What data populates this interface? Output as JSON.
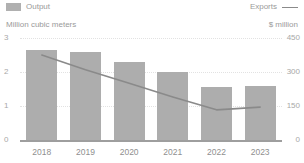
{
  "legend": {
    "output": {
      "label": "Output",
      "icon": "bar-swatch",
      "color": "#b0b0b0"
    },
    "exports": {
      "label": "Exports",
      "icon": "line-swatch",
      "color": "#8a8a8a"
    }
  },
  "axes": {
    "left_unit": "Million cubic meters",
    "right_unit": "$ million",
    "left_ticks": [
      "3",
      "2",
      "1",
      "0"
    ],
    "right_ticks": [
      "450",
      "300",
      "150",
      "0"
    ]
  },
  "chart_data": {
    "type": "bar",
    "title": "",
    "subtitle": "",
    "xlabel": "",
    "ylabel": "Million cubic meters",
    "y2label": "$ million",
    "categories": [
      "2018",
      "2019",
      "2020",
      "2021",
      "2022",
      "2023"
    ],
    "grid": true,
    "legend_position": "top",
    "ylim": [
      0,
      3
    ],
    "y2lim": [
      0,
      450
    ],
    "yticks": [
      0,
      1,
      2,
      3
    ],
    "y2ticks": [
      0,
      150,
      300,
      450
    ],
    "series": [
      {
        "name": "Output",
        "type": "bar",
        "axis": "left",
        "unit": "Million cubic meters",
        "color": "#adadad",
        "values": [
          2.65,
          2.6,
          2.3,
          2.0,
          1.55,
          1.6
        ]
      },
      {
        "name": "Exports",
        "type": "line",
        "axis": "right",
        "unit": "$ million",
        "color": "#8a8a8a",
        "values": [
          375,
          310,
          250,
          190,
          133,
          145
        ]
      }
    ]
  }
}
